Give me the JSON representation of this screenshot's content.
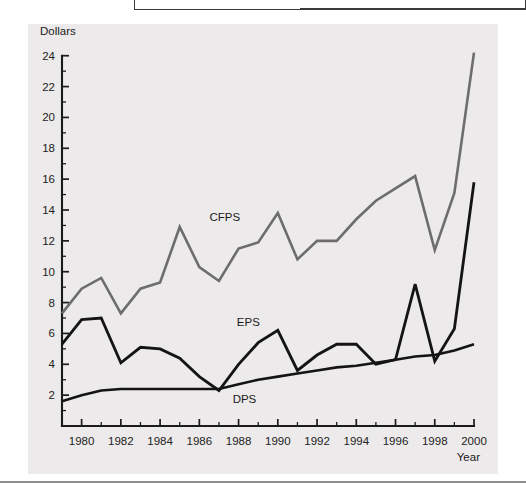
{
  "figure": {
    "background_color": "#eceaea",
    "axis_color": "#1b1b1b"
  },
  "chart_data": {
    "type": "line",
    "title": "",
    "subtitle": "",
    "xlabel": "Year",
    "ylabel": "Dollars",
    "xlim": [
      1979,
      2000
    ],
    "ylim": [
      0,
      24.5
    ],
    "grid": false,
    "legend_position": "inline-annotations",
    "x": [
      1979,
      1980,
      1981,
      1982,
      1983,
      1984,
      1985,
      1986,
      1987,
      1988,
      1989,
      1990,
      1991,
      1992,
      1993,
      1994,
      1995,
      1996,
      1997,
      1998,
      1999,
      2000
    ],
    "xticks_major": [
      1980,
      1982,
      1984,
      1986,
      1988,
      1990,
      1992,
      1994,
      1996,
      1998,
      2000
    ],
    "xticks_minor": [
      1979,
      1981,
      1983,
      1985,
      1987,
      1989,
      1991,
      1993,
      1995,
      1997,
      1999
    ],
    "yticks": [
      2,
      4,
      6,
      8,
      10,
      12,
      14,
      16,
      18,
      20,
      22,
      24
    ],
    "series": [
      {
        "name": "CFPS",
        "color": "#6d6d6d",
        "stroke_width": 2.6,
        "label_x": 1987.3,
        "label_y": 13.3,
        "values": [
          7.3,
          8.9,
          9.6,
          7.3,
          8.9,
          9.3,
          12.9,
          10.3,
          9.4,
          11.5,
          11.9,
          13.8,
          10.8,
          12.0,
          12.0,
          13.4,
          14.6,
          15.4,
          16.2,
          11.4,
          15.1,
          24.2
        ]
      },
      {
        "name": "EPS",
        "color": "#141414",
        "stroke_width": 2.8,
        "label_x": 1988.5,
        "label_y": 6.5,
        "values": [
          5.3,
          6.9,
          7.0,
          4.1,
          5.1,
          5.0,
          4.4,
          3.2,
          2.3,
          4.0,
          5.4,
          6.2,
          3.6,
          4.6,
          5.3,
          5.3,
          4.0,
          4.3,
          9.2,
          4.2,
          6.3,
          15.8
        ]
      },
      {
        "name": "DPS",
        "color": "#141414",
        "stroke_width": 2.6,
        "label_x": 1988.3,
        "label_y": 1.5,
        "values": [
          1.6,
          2.0,
          2.3,
          2.4,
          2.4,
          2.4,
          2.4,
          2.4,
          2.4,
          2.7,
          3.0,
          3.2,
          3.4,
          3.6,
          3.8,
          3.9,
          4.1,
          4.3,
          4.5,
          4.6,
          4.9,
          5.3
        ]
      }
    ]
  }
}
